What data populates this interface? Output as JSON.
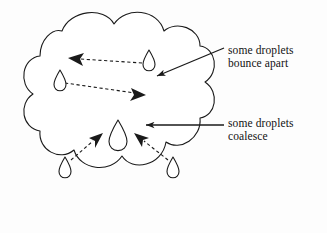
{
  "figure": {
    "background_color": "#fdfdfd",
    "stroke_color": "#1a1a1a",
    "fill_color": "#ffffff",
    "annotations": [
      {
        "name": "bounce-apart",
        "line1": "some droplets",
        "line2": "bounce apart",
        "arrow": "diagonal-down-left"
      },
      {
        "name": "coalesce",
        "line1": "some droplets",
        "line2": "coalesce",
        "arrow": "horizontal-left"
      }
    ],
    "cloud": {
      "name": "cloud-outline",
      "lobes": 9
    },
    "droplet_groups": [
      {
        "name": "bounce-apart-group",
        "droplets": 2,
        "arrowheads": 2,
        "arrow_style": "dashed",
        "pattern": "crossing-x"
      },
      {
        "name": "coalesce-group",
        "droplets": 3,
        "arrowheads": 2,
        "arrow_style": "dashed",
        "pattern": "converging"
      }
    ]
  }
}
